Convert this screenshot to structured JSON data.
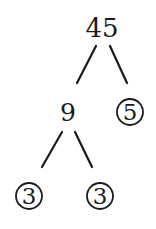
{
  "diagram": {
    "type": "factor-tree",
    "root": {
      "value": "45",
      "circled": false
    },
    "nodes": [
      {
        "id": "n45",
        "value": "45",
        "circled": false,
        "x": 102,
        "y": 28,
        "size": 26
      },
      {
        "id": "n9",
        "value": "9",
        "circled": false,
        "x": 68,
        "y": 112,
        "size": 24
      },
      {
        "id": "n5",
        "value": "5",
        "circled": true,
        "x": 130,
        "y": 112,
        "size": 24
      },
      {
        "id": "n3a",
        "value": "3",
        "circled": true,
        "x": 29,
        "y": 196,
        "size": 24
      },
      {
        "id": "n3b",
        "value": "3",
        "circled": true,
        "x": 100,
        "y": 196,
        "size": 24
      }
    ],
    "edges": [
      {
        "from": "n45",
        "to": "n9",
        "x1": 96,
        "y1": 46,
        "x2": 77,
        "y2": 83
      },
      {
        "from": "n45",
        "to": "n5",
        "x1": 110,
        "y1": 46,
        "x2": 127,
        "y2": 83
      },
      {
        "from": "n9",
        "to": "n3a",
        "x1": 62,
        "y1": 132,
        "x2": 42,
        "y2": 167
      },
      {
        "from": "n9",
        "to": "n3b",
        "x1": 75,
        "y1": 132,
        "x2": 92,
        "y2": 167
      }
    ],
    "prime_factors": [
      "3",
      "3",
      "5"
    ],
    "circle_radius": 13
  }
}
